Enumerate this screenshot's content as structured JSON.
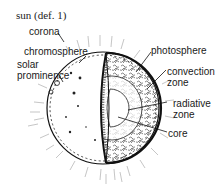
{
  "title": "sun (def. 1)",
  "labels": {
    "corona": "corona",
    "chromosphere": "chromosphere",
    "solar_prominence_1": "solar",
    "solar_prominence_2": "prominence",
    "photosphere": "photosphere",
    "convection_zone_1": "convection",
    "convection_zone_2": "zone",
    "radiative_zone_1": "radiative",
    "radiative_zone_2": "zone",
    "core": "core"
  }
}
